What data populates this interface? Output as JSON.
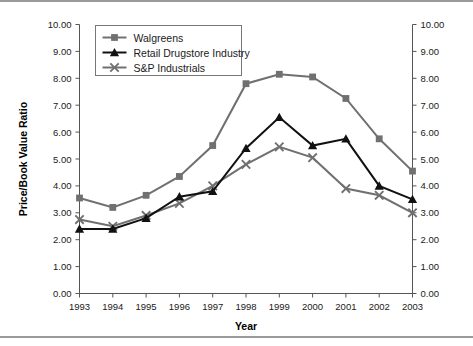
{
  "chart_data": {
    "type": "line",
    "title": "",
    "xlabel": "Year",
    "ylabel": "Price/Book Value Ratio",
    "categories": [
      "1993",
      "1994",
      "1995",
      "1996",
      "1997",
      "1998",
      "1999",
      "2000",
      "2001",
      "2002",
      "2003"
    ],
    "ylim": [
      0.0,
      10.0
    ],
    "ytick_step": 1.0,
    "ytick_labels": [
      "0.00",
      "1.00",
      "2.00",
      "3.00",
      "4.00",
      "5.00",
      "6.00",
      "7.00",
      "8.00",
      "9.00",
      "10.00"
    ],
    "grid": false,
    "legend_position": "top-left-inside",
    "dual_y_axis": true,
    "series": [
      {
        "name": "Walgreens",
        "color": "#707070",
        "marker": "square",
        "values": [
          3.55,
          3.2,
          3.65,
          4.35,
          5.5,
          7.8,
          8.15,
          8.05,
          7.25,
          5.75,
          4.55
        ]
      },
      {
        "name": "Retail Drugstore Industry",
        "color": "#111111",
        "marker": "triangle",
        "values": [
          2.4,
          2.4,
          2.8,
          3.6,
          3.8,
          5.4,
          6.55,
          5.5,
          5.75,
          4.0,
          3.5
        ]
      },
      {
        "name": "S&P Industrials",
        "color": "#707070",
        "marker": "x",
        "values": [
          2.75,
          2.5,
          2.9,
          3.35,
          4.0,
          4.8,
          5.45,
          5.05,
          3.9,
          3.65,
          3.0
        ]
      }
    ]
  },
  "figure": {
    "background": "#ffffff",
    "frame_color": "#9a9a9a"
  }
}
